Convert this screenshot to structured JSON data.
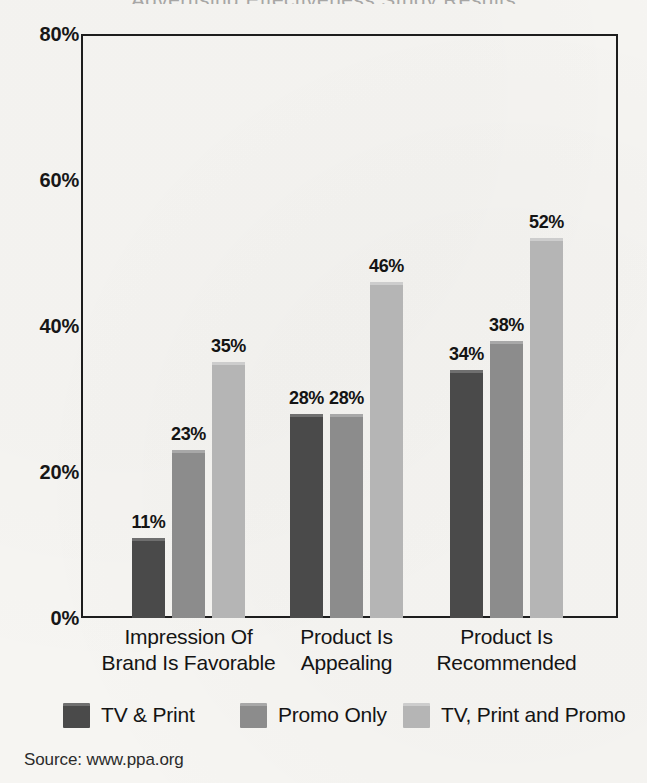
{
  "chart_data": {
    "type": "bar",
    "title": "",
    "xlabel": "",
    "ylabel": "",
    "ylim": [
      0,
      80
    ],
    "yticks": [
      0,
      20,
      40,
      60,
      80
    ],
    "ytick_labels": [
      "0%",
      "20%",
      "40%",
      "60%",
      "80%"
    ],
    "grid": false,
    "legend_position": "bottom",
    "value_suffix": "%",
    "categories": [
      "Impression Of Brand Is Favorable",
      "Product Is Appealing",
      "Product Is Recommended"
    ],
    "category_lines": [
      [
        "Impression Of",
        "Brand Is Favorable"
      ],
      [
        "Product Is",
        "Appealing"
      ],
      [
        "Product Is",
        "Recommended"
      ]
    ],
    "series": [
      {
        "name": "TV & Print",
        "color": "#4a4a4a",
        "highlight": "#6f6f6f",
        "values": [
          11,
          28,
          34
        ],
        "labels": [
          "11%",
          "28%",
          "34%"
        ]
      },
      {
        "name": "Promo Only",
        "color": "#8c8c8c",
        "highlight": "#a8a8a8",
        "values": [
          23,
          28,
          38
        ],
        "labels": [
          "23%",
          "28%",
          "38%"
        ]
      },
      {
        "name": "TV, Print and Promo",
        "color": "#b5b5b5",
        "highlight": "#cdcdcd",
        "values": [
          35,
          46,
          52
        ],
        "labels": [
          "35%",
          "46%",
          "52%"
        ]
      }
    ]
  },
  "legend": {
    "items": [
      {
        "label": "TV & Print"
      },
      {
        "label": "Promo Only"
      },
      {
        "label": "TV, Print and Promo"
      }
    ]
  },
  "source": {
    "text": "Source: www.ppa.org"
  },
  "title_remnant": {
    "text": "Advertising Effectiveness Study Results"
  },
  "colors": {
    "background": "#f6f5f2",
    "axis": "#1d1d1d",
    "text": "#141414",
    "series_dark": "#4a4a4a",
    "series_medium": "#8c8c8c",
    "series_light": "#b5b5b5"
  }
}
